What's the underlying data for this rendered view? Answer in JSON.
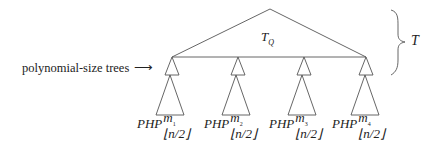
{
  "diagram": {
    "top_tree_label": "T",
    "top_tree_subscript": "Q",
    "brace_label": "T",
    "annotation": "polynomial-size trees",
    "annotation_arrow": "⟶",
    "leaves": [
      {
        "base": "PHP",
        "sup": "m",
        "sup_index": "1",
        "sub": "⌊n/2⌋"
      },
      {
        "base": "PHP",
        "sup": "m",
        "sup_index": "2",
        "sub": "⌊n/2⌋"
      },
      {
        "base": "PHP",
        "sup": "m",
        "sup_index": "3",
        "sub": "⌊n/2⌋"
      },
      {
        "base": "PHP",
        "sup": "m",
        "sup_index": "4",
        "sub": "⌊n/2⌋"
      }
    ],
    "colors": {
      "stroke": "#555555",
      "text": "#222222",
      "background": "#ffffff"
    }
  }
}
